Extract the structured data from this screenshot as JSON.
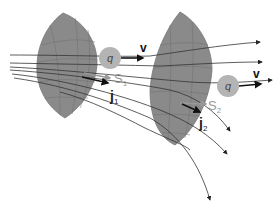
{
  "colors": {
    "surface_fill": "#8a8a8a",
    "surface_grid": "#6e6e6e",
    "charge_fill": "#b4b4b4",
    "label_gray": "#9a9a9a",
    "line": "#333333",
    "arrow": "#111111"
  },
  "labels": {
    "charge_1": "q",
    "velocity_1": "v",
    "surface_1": "S",
    "surface_1_sub": "1",
    "current_1": "j",
    "current_1_sub": "1",
    "charge_2": "q",
    "velocity_2": "v",
    "surface_2": "S",
    "surface_2_sub": "2",
    "current_2": "j",
    "current_2_sub": "2"
  }
}
